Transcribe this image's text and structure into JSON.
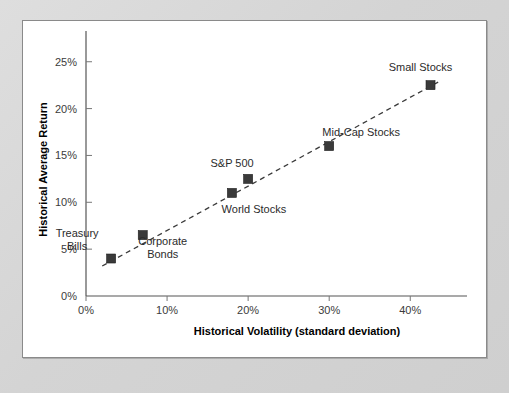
{
  "figure": {
    "background_color": "#ffffff",
    "mat_color": "#d8d8d8",
    "border_color": "#8a8a8a"
  },
  "chart_data": {
    "type": "scatter",
    "title": "",
    "xlabel": "Historical Volatility (standard deviation)",
    "ylabel": "Historical Average Return",
    "xlim": [
      0,
      47
    ],
    "ylim": [
      0,
      27
    ],
    "xticks": [
      0,
      10,
      20,
      30,
      40
    ],
    "xtick_labels": [
      "0%",
      "10%",
      "20%",
      "30%",
      "40%"
    ],
    "yticks": [
      0,
      5,
      10,
      15,
      20,
      25
    ],
    "ytick_labels": [
      "0%",
      "5%",
      "10%",
      "15%",
      "20%",
      "25%"
    ],
    "grid": false,
    "legend": "none",
    "marker_color": "#3a3a3a",
    "marker_shape": "square",
    "trendline": {
      "style": "dashed",
      "color": "#3a3a3a",
      "x_start": 2.0,
      "y_start": 3.2,
      "x_end": 43.8,
      "y_end": 23.0
    },
    "points": [
      {
        "label": "Treasury Bills",
        "x": 3.1,
        "y": 4.0,
        "label_dx": -34,
        "label_dy": -16,
        "label_anchor": "middle",
        "label_lines": [
          "Treasury",
          "Bills"
        ]
      },
      {
        "label": "Corporate Bonds",
        "x": 7.0,
        "y": 6.5,
        "label_dx": 20,
        "label_dy": 16,
        "label_anchor": "middle",
        "label_lines": [
          "Corporate",
          "Bonds"
        ]
      },
      {
        "label": "World Stocks",
        "x": 18.0,
        "y": 11.0,
        "label_dx": 22,
        "label_dy": 20,
        "label_anchor": "middle",
        "label_lines": [
          "World Stocks"
        ]
      },
      {
        "label": "S&P 500",
        "x": 20.0,
        "y": 12.5,
        "label_dx": -16,
        "label_dy": -12,
        "label_anchor": "middle",
        "label_lines": [
          "S&P 500"
        ]
      },
      {
        "label": "Mid-Cap Stocks",
        "x": 30.0,
        "y": 16.0,
        "label_dx": 32,
        "label_dy": -10,
        "label_anchor": "middle",
        "label_lines": [
          "Mid-Cap Stocks"
        ]
      },
      {
        "label": "Small Stocks",
        "x": 42.5,
        "y": 22.5,
        "label_dx": -10,
        "label_dy": -14,
        "label_anchor": "middle",
        "label_lines": [
          "Small Stocks"
        ]
      }
    ]
  }
}
